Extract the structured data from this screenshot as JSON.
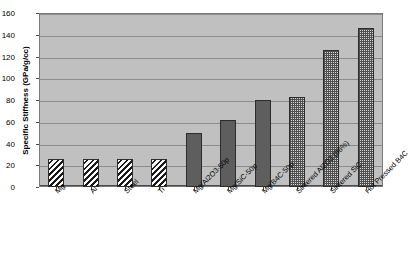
{
  "chart_data": {
    "type": "bar",
    "title": "",
    "xlabel": "",
    "ylabel": "Specific Stiffness (GPa/g/cc)",
    "ylim": [
      0,
      160
    ],
    "yticks": [
      0,
      20,
      40,
      60,
      80,
      100,
      120,
      140,
      160
    ],
    "grid": true,
    "legend": "none",
    "categories": [
      "Mg",
      "Al",
      "Steel",
      "Ti",
      "Mg/Al2O3-50p",
      "Mg/SiC-50p",
      "Mg/B4C-50p",
      "Sintered Al2O3 (96%)",
      "Sintered SiC",
      "Hot Pressed B4C"
    ],
    "values": [
      26,
      26,
      26,
      26,
      50,
      62,
      80,
      83,
      126,
      146
    ],
    "bar_patterns": [
      "hatch",
      "hatch",
      "hatch",
      "hatch",
      "solid",
      "solid",
      "solid",
      "check",
      "check",
      "check"
    ],
    "colors": {
      "plot_background": "#c0c0c0",
      "page_background": "#ffffff",
      "gridline": "#8c8c8c",
      "axis": "#4a4a4a",
      "bar_solid": "#5e5e5e",
      "bar_hatch_fg": "#1a1a1a",
      "bar_hatch_bg": "#ffffff",
      "bar_check_fg": "#4f4f4f",
      "bar_check_bg": "#d8d8d8",
      "bar_outline": "#2c2c2c",
      "text": "#000000"
    }
  }
}
